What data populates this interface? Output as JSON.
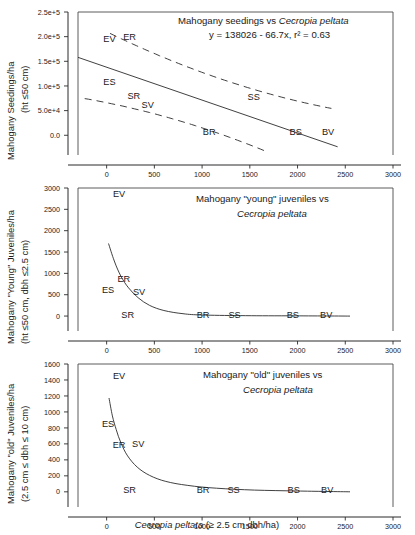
{
  "figure": {
    "x_axis_label_plain_1": "Cecropia peltata",
    "x_axis_label_plain_2": " (≥ 2.5 cm dbh/ha)",
    "shared_x_ticks": [
      "0",
      "500",
      "1000",
      "1500",
      "2000",
      "2500",
      "3000"
    ],
    "site_codes": [
      "EV",
      "ER",
      "ES",
      "SR",
      "SV",
      "SS",
      "BR",
      "BS",
      "BV"
    ]
  },
  "chart_data": [
    {
      "type": "scatter",
      "panel": 1,
      "title_plain": "Mahogany seedings vs ",
      "title_italic": "Cecropia peltata",
      "equation": "y = 138026 - 66.7x, r² = 0.63",
      "slope": -66.7,
      "intercept": 138026,
      "r2": 0.63,
      "ylabel_line1": "Mahogany Seedings/ha",
      "ylabel_line2": "(ht ≤50 cm)",
      "xlabel": "",
      "xlim": [
        -300,
        3000
      ],
      "ylim": [
        -40000,
        250000
      ],
      "ytick_labels": [
        "2.5e+5",
        "2.0e+5",
        "1.5e+5",
        "1.0e+5",
        "5.0e+4",
        "0.0"
      ],
      "ytick_values": [
        250000,
        200000,
        150000,
        100000,
        50000,
        0
      ],
      "xtick_labels": [
        "0",
        "500",
        "1000",
        "1500",
        "2000",
        "2500",
        "3000"
      ],
      "xtick_values": [
        0,
        500,
        1000,
        1500,
        2000,
        2500,
        3000
      ],
      "grid": false,
      "legend": "none",
      "point_labels": [
        {
          "code": "EV",
          "x": 30,
          "y": 196000
        },
        {
          "code": "ER",
          "x": 240,
          "y": 200000
        },
        {
          "code": "ES",
          "x": 30,
          "y": 109000
        },
        {
          "code": "SR",
          "x": 285,
          "y": 80000
        },
        {
          "code": "SV",
          "x": 430,
          "y": 62000
        },
        {
          "code": "SS",
          "x": 1540,
          "y": 78000
        },
        {
          "code": "BR",
          "x": 1075,
          "y": 6000
        },
        {
          "code": "BS",
          "x": 1980,
          "y": 6000
        },
        {
          "code": "BV",
          "x": 2320,
          "y": 7000
        }
      ]
    },
    {
      "type": "line",
      "panel": 2,
      "title_plain": "Mahogany \"young\"  juveniles vs",
      "title_italic": "Cecropia peltata",
      "ylabel_line1": "Mahogany \"Young\" Juveniles/ha",
      "ylabel_line2": "(ht ≤50 cm, dbh ≤2.5 cm)",
      "xlabel": "",
      "xlim": [
        -300,
        3000
      ],
      "ylim": [
        -350,
        3000
      ],
      "ytick_labels": [
        "3000",
        "2500",
        "2000",
        "1500",
        "1000",
        "500",
        "0"
      ],
      "ytick_values": [
        3000,
        2500,
        2000,
        1500,
        1000,
        500,
        0
      ],
      "xtick_labels": [
        "0",
        "500",
        "1000",
        "1500",
        "2000",
        "2500",
        "3000"
      ],
      "xtick_values": [
        0,
        500,
        1000,
        1500,
        2000,
        2500,
        3000
      ],
      "grid": false,
      "legend": "none",
      "curve_points": [
        {
          "x": 20,
          "y": 1700
        },
        {
          "x": 80,
          "y": 1290
        },
        {
          "x": 150,
          "y": 930
        },
        {
          "x": 230,
          "y": 660
        },
        {
          "x": 330,
          "y": 430
        },
        {
          "x": 450,
          "y": 250
        },
        {
          "x": 600,
          "y": 130
        },
        {
          "x": 800,
          "y": 55
        },
        {
          "x": 1000,
          "y": 25
        },
        {
          "x": 1400,
          "y": 10
        },
        {
          "x": 1900,
          "y": 5
        },
        {
          "x": 2550,
          "y": 0
        }
      ],
      "point_labels": [
        {
          "code": "EV",
          "x": 130,
          "y": 2870
        },
        {
          "code": "ER",
          "x": 180,
          "y": 860
        },
        {
          "code": "ES",
          "x": 15,
          "y": 600
        },
        {
          "code": "SV",
          "x": 340,
          "y": 570
        },
        {
          "code": "SR",
          "x": 220,
          "y": 25
        },
        {
          "code": "BR",
          "x": 1010,
          "y": 25
        },
        {
          "code": "SS",
          "x": 1340,
          "y": 25
        },
        {
          "code": "BS",
          "x": 1950,
          "y": 25
        },
        {
          "code": "BV",
          "x": 2300,
          "y": 25
        }
      ]
    },
    {
      "type": "line",
      "panel": 3,
      "title_plain": "Mahogany \"old\" juveniles vs",
      "title_italic": "Cecropia peltata",
      "ylabel_line1": "Mahogany \"old\" Juveniles/ha",
      "ylabel_line2": "(2.5 cm ≤ dbh ≤ 10 cm)",
      "xlabel_plain": "Cecropia peltata",
      "xlabel_suffix": " (≥ 2.5 cm dbh/ha)",
      "xlim": [
        -300,
        3000
      ],
      "ylim": [
        -190,
        1600
      ],
      "ytick_labels": [
        "1600",
        "1400",
        "1200",
        "1000",
        "800",
        "600",
        "400",
        "200",
        "0"
      ],
      "ytick_values": [
        1600,
        1400,
        1200,
        1000,
        800,
        600,
        400,
        200,
        0
      ],
      "xtick_labels": [
        "0",
        "500",
        "1000",
        "1500",
        "2000",
        "2500",
        "3000"
      ],
      "xtick_values": [
        0,
        500,
        1000,
        1500,
        2000,
        2500,
        3000
      ],
      "grid": false,
      "legend": "none",
      "curve_points": [
        {
          "x": 25,
          "y": 1175
        },
        {
          "x": 60,
          "y": 950
        },
        {
          "x": 100,
          "y": 780
        },
        {
          "x": 150,
          "y": 610
        },
        {
          "x": 220,
          "y": 450
        },
        {
          "x": 320,
          "y": 310
        },
        {
          "x": 450,
          "y": 205
        },
        {
          "x": 620,
          "y": 130
        },
        {
          "x": 850,
          "y": 80
        },
        {
          "x": 1150,
          "y": 45
        },
        {
          "x": 1550,
          "y": 22
        },
        {
          "x": 2000,
          "y": 10
        },
        {
          "x": 2550,
          "y": 0
        }
      ],
      "point_labels": [
        {
          "code": "EV",
          "x": 130,
          "y": 1450
        },
        {
          "code": "ES",
          "x": 15,
          "y": 845
        },
        {
          "code": "ER",
          "x": 130,
          "y": 590
        },
        {
          "code": "SV",
          "x": 330,
          "y": 595
        },
        {
          "code": "SR",
          "x": 240,
          "y": 20
        },
        {
          "code": "BR",
          "x": 1010,
          "y": 20
        },
        {
          "code": "SS",
          "x": 1330,
          "y": 20
        },
        {
          "code": "BS",
          "x": 1960,
          "y": 20
        },
        {
          "code": "BV",
          "x": 2310,
          "y": 20
        }
      ]
    }
  ]
}
